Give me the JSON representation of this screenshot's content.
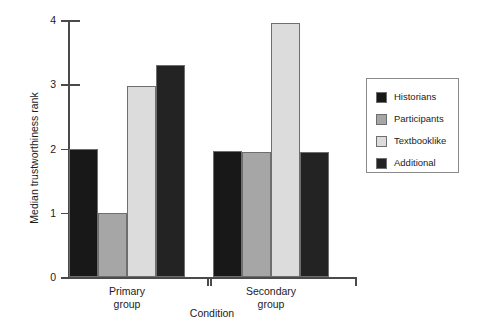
{
  "chart_data": {
    "type": "bar",
    "title": "",
    "xlabel": "Condition",
    "ylabel": "Median trustworthiness rank",
    "ylim": [
      0,
      4
    ],
    "ytick_labels": [
      "0",
      "1",
      "2",
      "3",
      "4"
    ],
    "ytick_values": [
      0,
      1,
      2,
      3,
      4
    ],
    "grid": false,
    "legend_position": "right",
    "categories": [
      "Primary group",
      "Secondary group"
    ],
    "category_lines": [
      [
        "Primary",
        "group"
      ],
      [
        "Secondary",
        "group"
      ]
    ],
    "series": [
      {
        "name": "Historians",
        "color": "#181818",
        "values": [
          2.0,
          1.96
        ]
      },
      {
        "name": "Participants",
        "color": "#a6a6a6",
        "values": [
          1.0,
          1.95
        ]
      },
      {
        "name": "Textbooklike",
        "color": "#dcdcdc",
        "values": [
          2.98,
          3.95
        ]
      },
      {
        "name": "Additional",
        "color": "#232323",
        "values": [
          3.3,
          1.94
        ]
      }
    ]
  },
  "axes": {
    "y_title": "Median trustworthiness rank",
    "x_title": "Condition",
    "y_ticks": [
      {
        "label": "4",
        "value": 4
      },
      {
        "label": "3",
        "value": 3
      },
      {
        "label": "2",
        "value": 2
      },
      {
        "label": "1",
        "value": 1
      },
      {
        "label": "0",
        "value": 0
      }
    ]
  },
  "legend": {
    "items": [
      {
        "label": "Historians",
        "color": "#181818"
      },
      {
        "label": "Participants",
        "color": "#a6a6a6"
      },
      {
        "label": "Textbooklike",
        "color": "#dcdcdc"
      },
      {
        "label": "Additional",
        "color": "#232323"
      }
    ]
  }
}
